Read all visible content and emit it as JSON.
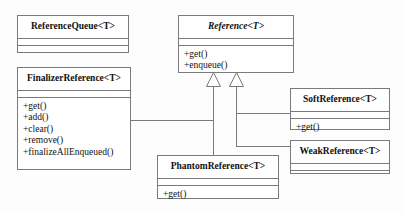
{
  "diagram": {
    "type": "uml-class-diagram",
    "background_color": "#fdfdfd",
    "line_color": "#7a7a7a",
    "text_color": "#111111"
  },
  "classes": [
    {
      "id": "reference-queue",
      "name": "ReferenceQueue<T>",
      "abstract": false,
      "attributes": [],
      "operations": []
    },
    {
      "id": "reference",
      "name": "Reference<T>",
      "abstract": true,
      "attributes": [],
      "operations": [
        "+get()",
        "+enqueue()"
      ]
    },
    {
      "id": "finalizer-reference",
      "name": "FinalizerReference<T>",
      "abstract": false,
      "attributes": [],
      "operations": [
        "+get()",
        "+add()",
        "+clear()",
        "+remove()",
        "+finalizeAllEnqueued()"
      ]
    },
    {
      "id": "soft-reference",
      "name": "SoftReference<T>",
      "abstract": false,
      "attributes": [],
      "operations": [
        "+get()"
      ]
    },
    {
      "id": "weak-reference",
      "name": "WeakReference<T>",
      "abstract": false,
      "attributes": [],
      "operations": []
    },
    {
      "id": "phantom-reference",
      "name": "PhantomReference<T>",
      "abstract": false,
      "attributes": [],
      "operations": [
        "+get()"
      ]
    }
  ],
  "relationships": [
    {
      "type": "generalization",
      "from": "finalizer-reference",
      "to": "reference"
    },
    {
      "type": "generalization",
      "from": "phantom-reference",
      "to": "reference"
    },
    {
      "type": "generalization",
      "from": "soft-reference",
      "to": "reference"
    },
    {
      "type": "generalization",
      "from": "weak-reference",
      "to": "reference"
    }
  ]
}
